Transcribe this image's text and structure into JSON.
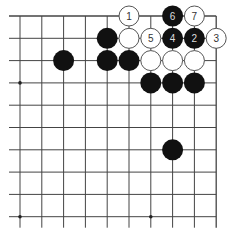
{
  "diagram": {
    "type": "go-board-fragment",
    "grid": {
      "columns": 10,
      "rows": 10,
      "origin_x": 20,
      "origin_y": 16,
      "spacing_x": 21.8,
      "spacing_y": 22.3,
      "closed_edges": [
        "top",
        "right"
      ],
      "open_edges": [
        "left",
        "bottom"
      ],
      "line_color": "#444444"
    },
    "star_points": [
      {
        "col": 0,
        "row": 3
      },
      {
        "col": 0,
        "row": 9
      },
      {
        "col": 6,
        "row": 9
      }
    ],
    "colors": {
      "black_stone": "#111111",
      "white_stone_fill": "#ffffff",
      "white_stone_stroke": "#555555",
      "label_on_black": "#dddddd",
      "label_on_white": "#333333"
    },
    "stones": [
      {
        "color": "white",
        "col": 5,
        "row": 0,
        "label": "1"
      },
      {
        "color": "black",
        "col": 7,
        "row": 0,
        "label": "6"
      },
      {
        "color": "white",
        "col": 8,
        "row": 0,
        "label": "7"
      },
      {
        "color": "black",
        "col": 4,
        "row": 1,
        "label": ""
      },
      {
        "color": "white",
        "col": 5,
        "row": 1,
        "label": ""
      },
      {
        "color": "white",
        "col": 6,
        "row": 1,
        "label": "5"
      },
      {
        "color": "black",
        "col": 7,
        "row": 1,
        "label": "4"
      },
      {
        "color": "black",
        "col": 8,
        "row": 1,
        "label": "2"
      },
      {
        "color": "white",
        "col": 9,
        "row": 1,
        "label": "3"
      },
      {
        "color": "black",
        "col": 2,
        "row": 2,
        "label": ""
      },
      {
        "color": "black",
        "col": 4,
        "row": 2,
        "label": ""
      },
      {
        "color": "black",
        "col": 5,
        "row": 2,
        "label": ""
      },
      {
        "color": "white",
        "col": 6,
        "row": 2,
        "label": ""
      },
      {
        "color": "white",
        "col": 7,
        "row": 2,
        "label": ""
      },
      {
        "color": "white",
        "col": 8,
        "row": 2,
        "label": ""
      },
      {
        "color": "black",
        "col": 6,
        "row": 3,
        "label": ""
      },
      {
        "color": "black",
        "col": 7,
        "row": 3,
        "label": ""
      },
      {
        "color": "black",
        "col": 8,
        "row": 3,
        "label": ""
      },
      {
        "color": "black",
        "col": 7,
        "row": 6,
        "label": ""
      }
    ]
  }
}
